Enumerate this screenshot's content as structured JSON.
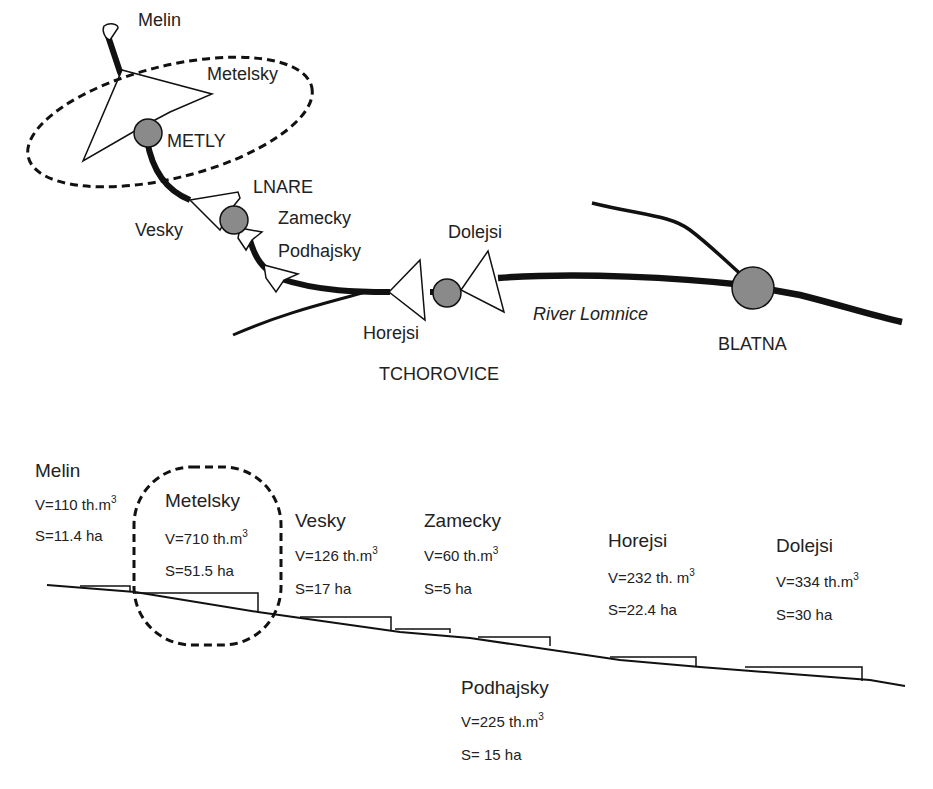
{
  "map": {
    "towns": [
      {
        "name": "METLY"
      },
      {
        "name": "LNARE"
      },
      {
        "name": "TCHOROVICE"
      },
      {
        "name": "BLATNA"
      }
    ],
    "ponds": [
      {
        "name": "Melin"
      },
      {
        "name": "Metelsky"
      },
      {
        "name": "Vesky"
      },
      {
        "name": "Zamecky"
      },
      {
        "name": "Podhajsky"
      },
      {
        "name": "Horejsi"
      },
      {
        "name": "Dolejsi"
      }
    ],
    "river": "River Lomnice",
    "colors": {
      "town_fill": "#8a8a8a",
      "line": "#111111"
    }
  },
  "profile": {
    "ponds": [
      {
        "name": "Melin",
        "volume": "V=110 th.m",
        "area": "S=11.4 ha"
      },
      {
        "name": "Metelsky",
        "volume": "V=710 th.m",
        "area": "S=51.5 ha"
      },
      {
        "name": "Vesky",
        "volume": "V=126 th.m",
        "area": "S=17 ha"
      },
      {
        "name": "Zamecky",
        "volume": "V=60 th.m",
        "area": "S=5 ha"
      },
      {
        "name": "Podhajsky",
        "volume": "V=225 th.m",
        "area": "S= 15 ha"
      },
      {
        "name": "Horejsi",
        "volume": "V=232 th. m",
        "area": "S=22.4 ha"
      },
      {
        "name": "Dolejsi",
        "volume": "V=334 th.m",
        "area": "S=30 ha"
      }
    ],
    "unit_superscript": "3"
  }
}
